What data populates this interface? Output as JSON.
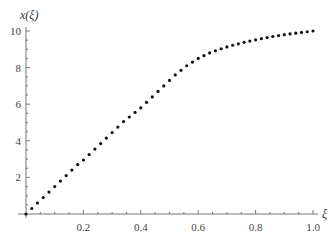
{
  "chart_data": {
    "type": "scatter",
    "title": "",
    "xlabel": "ξ",
    "ylabel": "x(ξ)",
    "xlim": [
      0,
      1.0
    ],
    "ylim": [
      0,
      10
    ],
    "x_ticks": [
      "0.2",
      "0.4",
      "0.6",
      "0.8",
      "1.0"
    ],
    "y_ticks": [
      "2",
      "4",
      "6",
      "8",
      "10"
    ],
    "grid": false,
    "legend": null,
    "x": [
      0.0,
      0.02,
      0.04,
      0.06,
      0.08,
      0.1,
      0.12,
      0.14,
      0.16,
      0.18,
      0.2,
      0.22,
      0.24,
      0.26,
      0.28,
      0.3,
      0.32,
      0.34,
      0.36,
      0.38,
      0.4,
      0.42,
      0.44,
      0.46,
      0.48,
      0.5,
      0.52,
      0.54,
      0.56,
      0.58,
      0.6,
      0.62,
      0.64,
      0.66,
      0.68,
      0.7,
      0.72,
      0.74,
      0.76,
      0.78,
      0.8,
      0.82,
      0.84,
      0.86,
      0.88,
      0.9,
      0.92,
      0.94,
      0.96,
      0.98,
      1.0
    ],
    "y": [
      0.0,
      0.3,
      0.6,
      0.9,
      1.2,
      1.5,
      1.8,
      2.1,
      2.4,
      2.7,
      2.95,
      3.25,
      3.55,
      3.85,
      4.15,
      4.45,
      4.75,
      5.05,
      5.3,
      5.55,
      5.8,
      6.1,
      6.4,
      6.7,
      7.0,
      7.3,
      7.6,
      7.85,
      8.1,
      8.3,
      8.5,
      8.65,
      8.8,
      8.92,
      9.03,
      9.13,
      9.22,
      9.3,
      9.38,
      9.45,
      9.52,
      9.58,
      9.64,
      9.7,
      9.75,
      9.8,
      9.84,
      9.88,
      9.92,
      9.96,
      10.0
    ]
  },
  "colors": {
    "points": "#111111",
    "axis": "#777777",
    "text": "#444444"
  }
}
